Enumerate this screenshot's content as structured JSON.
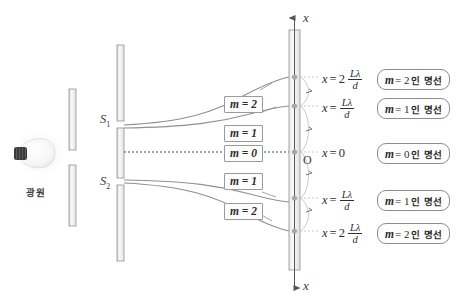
{
  "figure": {
    "source": {
      "label": "광원",
      "icon": "lightbulb-icon"
    },
    "single_slit": {
      "name": "single-slit-plate"
    },
    "double_slit": {
      "name": "double-slit-plate",
      "slit_top": "S",
      "slit_top_sub": "1",
      "slit_bottom": "S",
      "slit_bottom_sub": "2"
    },
    "screen": {
      "name": "screen",
      "axis_label_top": "x",
      "axis_label_bottom": "x",
      "origin_label": "O"
    },
    "ray_labels": [
      {
        "m": "2",
        "eq": "m = 2"
      },
      {
        "m": "1",
        "eq": "m = 1"
      },
      {
        "m": "0",
        "eq": "m = 0"
      },
      {
        "m": "1",
        "eq": "m = 1"
      },
      {
        "m": "2",
        "eq": "m = 2"
      }
    ],
    "fringes": [
      {
        "order": "2",
        "equation": {
          "var": "x",
          "rel": "=",
          "coef": "2",
          "num": "Lλ",
          "den": "d"
        },
        "callout": {
          "m": "m",
          "rel": "= 2",
          "text": "인 명선"
        }
      },
      {
        "order": "1",
        "equation": {
          "var": "x",
          "rel": "=",
          "coef": "",
          "num": "Lλ",
          "den": "d"
        },
        "callout": {
          "m": "m",
          "rel": "= 1",
          "text": "인 명선"
        }
      },
      {
        "order": "0",
        "equation": {
          "var": "x",
          "rel": "=",
          "coef": "0",
          "num": "",
          "den": ""
        },
        "callout": {
          "m": "m",
          "rel": "= 0",
          "text": "인 명선"
        }
      },
      {
        "order": "1",
        "equation": {
          "var": "x",
          "rel": "=",
          "coef": "",
          "num": "Lλ",
          "den": "d"
        },
        "callout": {
          "m": "m",
          "rel": "= 1",
          "text": "인 명선"
        }
      },
      {
        "order": "2",
        "equation": {
          "var": "x",
          "rel": "=",
          "coef": "2",
          "num": "Lλ",
          "den": "d"
        },
        "callout": {
          "m": "m",
          "rel": "= 2",
          "text": "인 명선"
        }
      }
    ],
    "colors": {
      "background": "#ffffff",
      "bar_fill": "#f2f2f2",
      "bar_stroke": "#9a9a9a",
      "ray_stroke": "#8a8a8a",
      "axis_stroke": "#555555",
      "fringe_dot": "#a8a8a8",
      "text": "#2e2e2e",
      "bulb_base": "#3a3a3a",
      "bulb_glass": "#fbfbfb"
    }
  }
}
